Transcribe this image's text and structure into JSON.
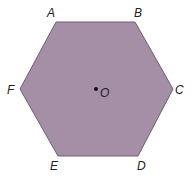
{
  "diagram": {
    "type": "regular-hexagon",
    "fill_color": "#a48fa6",
    "stroke_color": "#6e5f70",
    "center": {
      "label": "O",
      "x": 96,
      "y": 89
    },
    "vertices": [
      {
        "label": "A",
        "x": 56,
        "y": 22
      },
      {
        "label": "B",
        "x": 135,
        "y": 22
      },
      {
        "label": "C",
        "x": 173,
        "y": 89
      },
      {
        "label": "D",
        "x": 138,
        "y": 156
      },
      {
        "label": "E",
        "x": 58,
        "y": 156
      },
      {
        "label": "F",
        "x": 20,
        "y": 89
      }
    ]
  }
}
